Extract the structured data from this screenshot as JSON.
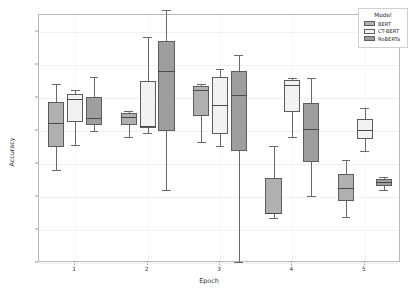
{
  "chart_data": {
    "type": "box",
    "title": "",
    "xlabel": "Epoch",
    "ylabel": "Accuracy",
    "ylim": [
      78.0,
      81.75
    ],
    "yticks": [
      "78.0",
      "78.5",
      "79.0",
      "79.5",
      "80.0",
      "80.5",
      "81.0",
      "81.5"
    ],
    "ytick_values": [
      78.0,
      78.5,
      79.0,
      79.5,
      80.0,
      80.5,
      81.0,
      81.5
    ],
    "categories": [
      "1",
      "2",
      "3",
      "4",
      "5"
    ],
    "grid": true,
    "legend": {
      "title": "Model",
      "position": "top-right",
      "entries": [
        {
          "label": "BERT",
          "color": "#b0b0b0"
        },
        {
          "label": "CT-BERT",
          "color": "#f2f2f2"
        },
        {
          "label": "RoBERTa",
          "color": "#9e9e9e"
        }
      ]
    },
    "series": [
      {
        "name": "BERT",
        "color": "#b0b0b0",
        "boxes": [
          {
            "epoch": "1",
            "whisker_low": 79.41,
            "q1": 79.76,
            "median": 80.11,
            "q3": 80.43,
            "whisker_high": 80.71
          },
          {
            "epoch": "2",
            "whisker_low": 79.9,
            "q1": 80.08,
            "median": 80.21,
            "q3": 80.27,
            "whisker_high": 80.3
          },
          {
            "epoch": "3",
            "whisker_low": 79.83,
            "q1": 80.22,
            "median": 80.62,
            "q3": 80.67,
            "whisker_high": 80.7
          },
          {
            "epoch": "4",
            "whisker_low": 78.68,
            "q1": 78.74,
            "median": 78.76,
            "q3": 79.29,
            "whisker_high": 79.77
          },
          {
            "epoch": "5",
            "whisker_low": 78.7,
            "q1": 78.94,
            "median": 79.13,
            "q3": 79.35,
            "whisker_high": 79.55
          }
        ]
      },
      {
        "name": "CT-BERT",
        "color": "#f2f2f2",
        "boxes": [
          {
            "epoch": "1",
            "whisker_low": 79.79,
            "q1": 80.13,
            "median": 80.48,
            "q3": 80.56,
            "whisker_high": 80.61
          },
          {
            "epoch": "2",
            "whisker_low": 79.97,
            "q1": 80.04,
            "median": 80.07,
            "q3": 80.75,
            "whisker_high": 81.42
          },
          {
            "epoch": "3",
            "whisker_low": 79.77,
            "q1": 79.95,
            "median": 80.39,
            "q3": 80.81,
            "whisker_high": 80.94
          },
          {
            "epoch": "4",
            "whisker_low": 79.9,
            "q1": 80.29,
            "median": 80.69,
            "q3": 80.77,
            "whisker_high": 80.8
          },
          {
            "epoch": "5",
            "whisker_low": 79.7,
            "q1": 79.87,
            "median": 80.01,
            "q3": 80.17,
            "whisker_high": 80.35
          }
        ]
      },
      {
        "name": "RoBERTa",
        "color": "#9e9e9e",
        "boxes": [
          {
            "epoch": "1",
            "whisker_low": 79.99,
            "q1": 80.08,
            "median": 80.19,
            "q3": 80.51,
            "whisker_high": 80.81
          },
          {
            "epoch": "2",
            "whisker_low": 79.1,
            "q1": 79.99,
            "median": 80.9,
            "q3": 81.36,
            "whisker_high": 81.82
          },
          {
            "epoch": "3",
            "whisker_low": 78.02,
            "q1": 79.7,
            "median": 80.54,
            "q3": 80.9,
            "whisker_high": 81.15
          },
          {
            "epoch": "4",
            "whisker_low": 79.02,
            "q1": 79.53,
            "median": 80.02,
            "q3": 80.42,
            "whisker_high": 80.8
          },
          {
            "epoch": "5",
            "whisker_low": 79.1,
            "q1": 79.16,
            "median": 79.22,
            "q3": 79.27,
            "whisker_high": 79.3
          }
        ]
      }
    ]
  }
}
